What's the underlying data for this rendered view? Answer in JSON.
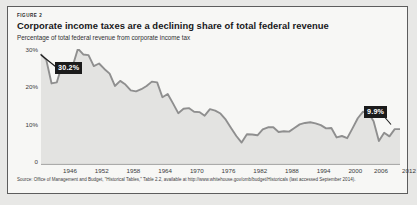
{
  "figure": {
    "kicker": "FIGURE 2",
    "title": "Corporate income taxes are a declining share of total federal revenue",
    "subtitle": "Percentage of total federal revenue from corporate income tax",
    "source": "Source: Office of Management and Budget, \"Historical Tables,\" Table 2.2, available at http://www.whitehouse.gov/omb/budget/Historicals (last accessed September 2014)."
  },
  "callouts": {
    "peak": "30.2%",
    "last": "9.9%"
  },
  "axes": {
    "y_ticks": [
      "30%",
      "20%",
      "10%",
      "0"
    ],
    "x_ticks": [
      "1946",
      "1952",
      "1958",
      "1964",
      "1970",
      "1976",
      "1982",
      "1988",
      "1994",
      "2000",
      "2006",
      "2012"
    ]
  },
  "colors": {
    "line": "#8f8f8f",
    "fill": "#e3e3e1",
    "callout_bg": "#1b1b1b",
    "card_bg": "#f7f7f5",
    "border": "#5d5d5d"
  },
  "chart_data": {
    "type": "area",
    "title": "Corporate income taxes are a declining share of total federal revenue",
    "subtitle": "Percentage of total federal revenue from corporate income tax",
    "xlabel": "",
    "ylabel": "Percentage of total federal revenue from corporate income tax",
    "xlim": [
      1945,
      2013
    ],
    "ylim": [
      0,
      32
    ],
    "grid": false,
    "legend": null,
    "y_tick_values": [
      0,
      10,
      20,
      30
    ],
    "y_tick_labels": [
      "0",
      "10%",
      "20%",
      "30%"
    ],
    "x_tick_values": [
      1946,
      1952,
      1958,
      1964,
      1970,
      1976,
      1982,
      1988,
      1994,
      2000,
      2006,
      2012
    ],
    "annotations": [
      {
        "label": "30.2%",
        "x": 1952,
        "y": 32.1
      },
      {
        "label": "9.9%",
        "x": 2012,
        "y": 9.9
      }
    ],
    "x": [
      1945,
      1946,
      1947,
      1948,
      1949,
      1950,
      1951,
      1952,
      1953,
      1954,
      1955,
      1956,
      1957,
      1958,
      1959,
      1960,
      1961,
      1962,
      1963,
      1964,
      1965,
      1966,
      1967,
      1968,
      1969,
      1970,
      1971,
      1972,
      1973,
      1974,
      1975,
      1976,
      1977,
      1978,
      1979,
      1980,
      1981,
      1982,
      1983,
      1984,
      1985,
      1986,
      1987,
      1988,
      1989,
      1990,
      1991,
      1992,
      1993,
      1994,
      1995,
      1996,
      1997,
      1998,
      1999,
      2000,
      2001,
      2002,
      2003,
      2004,
      2005,
      2006,
      2007,
      2008,
      2009,
      2010,
      2011,
      2012,
      2013
    ],
    "values": [
      30.5,
      29.0,
      22.5,
      22.8,
      27.7,
      26.5,
      27.3,
      32.1,
      30.5,
      30.3,
      27.3,
      28.0,
      26.5,
      25.2,
      21.8,
      23.2,
      22.2,
      20.6,
      20.3,
      20.9,
      21.8,
      23.0,
      22.8,
      18.7,
      19.6,
      17.0,
      14.3,
      15.5,
      15.7,
      14.7,
      14.6,
      13.6,
      15.4,
      15.0,
      14.2,
      12.5,
      10.2,
      8.0,
      6.2,
      8.5,
      8.4,
      8.2,
      9.8,
      10.4,
      10.4,
      9.1,
      9.3,
      9.2,
      10.2,
      11.2,
      11.6,
      11.8,
      11.5,
      11.0,
      10.1,
      10.2,
      7.6,
      8.0,
      7.4,
      10.1,
      12.9,
      14.7,
      14.4,
      12.1,
      6.6,
      8.9,
      7.9,
      9.9,
      9.9
    ]
  }
}
